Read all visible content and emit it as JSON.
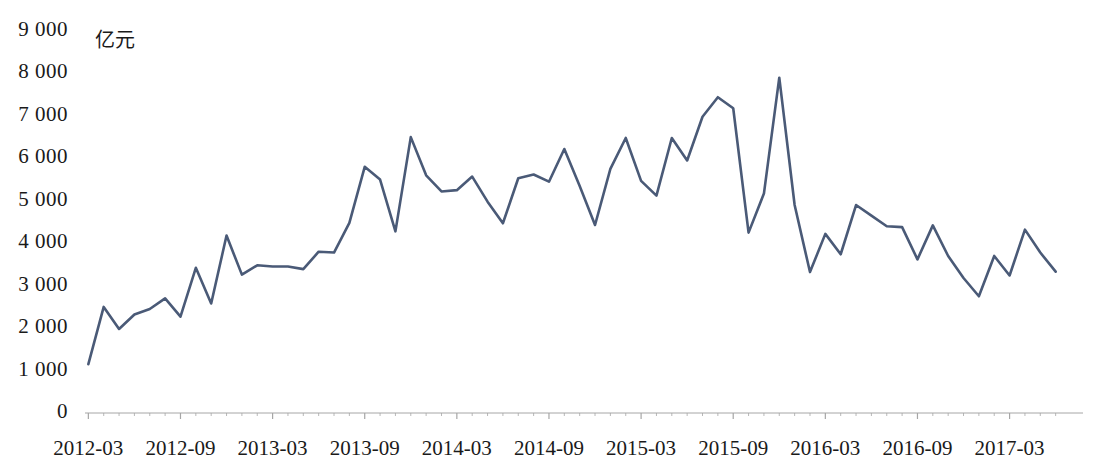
{
  "chart_data": {
    "type": "line",
    "title": "",
    "subtitle": "",
    "xlabel": "",
    "ylabel": "亿元",
    "unit_label": "亿元",
    "ylim": [
      0,
      9000
    ],
    "ytick_step": 1000,
    "ytick_labels": [
      "9 000",
      "8 000",
      "7 000",
      "6 000",
      "5 000",
      "4 000",
      "3 000",
      "2 000",
      "1 000",
      "0"
    ],
    "ytick_values": [
      9000,
      8000,
      7000,
      6000,
      5000,
      4000,
      3000,
      2000,
      1000,
      0
    ],
    "xtick_labels": [
      "2012-03",
      "2012-09",
      "2013-03",
      "2013-09",
      "2014-03",
      "2014-09",
      "2015-03",
      "2015-09",
      "2016-03",
      "2016-09",
      "2017-03"
    ],
    "x_major_interval_months": 6,
    "x_minor_interval_months": 1,
    "grid": false,
    "legend": null,
    "legend_position": "none",
    "line_color": "#4a5a77",
    "axis_color": "#a6a6a6",
    "line_width": 2.6,
    "x": [
      "2012-03",
      "2012-04",
      "2012-05",
      "2012-06",
      "2012-07",
      "2012-08",
      "2012-09",
      "2012-10",
      "2012-11",
      "2012-12",
      "2013-01",
      "2013-02",
      "2013-03",
      "2013-04",
      "2013-05",
      "2013-06",
      "2013-07",
      "2013-08",
      "2013-09",
      "2013-10",
      "2013-11",
      "2013-12",
      "2014-01",
      "2014-02",
      "2014-03",
      "2014-04",
      "2014-05",
      "2014-06",
      "2014-07",
      "2014-08",
      "2014-09",
      "2014-10",
      "2014-11",
      "2014-12",
      "2015-01",
      "2015-02",
      "2015-03",
      "2015-04",
      "2015-05",
      "2015-06",
      "2015-07",
      "2015-08",
      "2015-09",
      "2015-10",
      "2015-11",
      "2015-12",
      "2016-01",
      "2016-02",
      "2016-03",
      "2016-04",
      "2016-05",
      "2016-06",
      "2016-07",
      "2016-08",
      "2016-09",
      "2016-10",
      "2016-11",
      "2016-12",
      "2017-01",
      "2017-02",
      "2017-03",
      "2017-04",
      "2017-05",
      "2017-06"
    ],
    "values": [
      1150,
      2500,
      1980,
      2320,
      2450,
      2700,
      2270,
      3420,
      2580,
      4180,
      3260,
      3480,
      3450,
      3450,
      3390,
      3800,
      3780,
      4480,
      5800,
      5500,
      4280,
      6500,
      5600,
      5220,
      5250,
      5570,
      4980,
      4470,
      5530,
      5620,
      5450,
      6220,
      5350,
      4430,
      5750,
      6480,
      5470,
      5120,
      6480,
      5950,
      6980,
      7440,
      7180,
      4250,
      5170,
      7900,
      4900,
      3320,
      4220,
      3740,
      4900,
      4650,
      4400,
      4380,
      3620,
      4420,
      3700,
      3180,
      2750,
      3700,
      3240,
      4320,
      3780,
      3330
    ]
  }
}
